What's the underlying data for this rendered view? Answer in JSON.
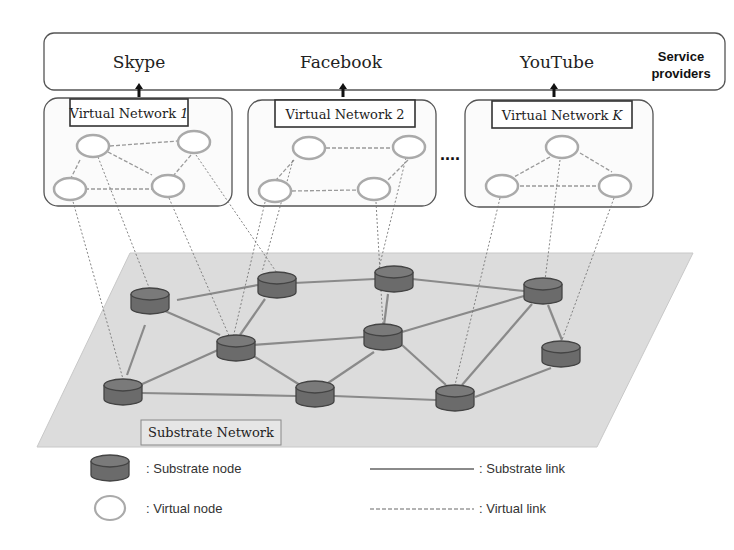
{
  "service_bar": {
    "label": "Service providers",
    "label_line1": "Service",
    "label_line2": "providers",
    "providers": [
      "Skype",
      "Facebook",
      "YouTube"
    ]
  },
  "virtual_networks": [
    {
      "title": "Virtual Network ",
      "index": "1"
    },
    {
      "title": "Virtual Network ",
      "index": "2"
    },
    {
      "title": "Virtual Network ",
      "index": "K"
    }
  ],
  "ellipsis": "....",
  "substrate": {
    "label": "Substrate Network"
  },
  "legend": {
    "substrate_node": ": Substrate node",
    "virtual_node": ": Virtual node",
    "substrate_link": ": Substrate link",
    "virtual_link": ": Virtual link"
  },
  "colors": {
    "substrate_node_fill": "#6b6b6b",
    "substrate_node_top": "#7a7a7a",
    "plane_fill": "#d9d9d9",
    "substrate_link": "#8a8a8a",
    "virtual_link": "#999999",
    "virtual_node_stroke": "#a9a9a9"
  }
}
